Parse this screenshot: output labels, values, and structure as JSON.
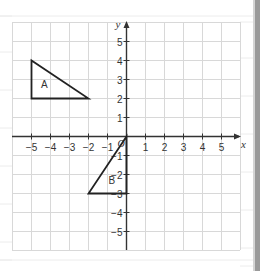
{
  "figure": {
    "x_axis_label": "x",
    "y_axis_label": "y",
    "origin_label": "O",
    "x_range": [
      -6,
      6
    ],
    "y_range": [
      -6,
      6
    ],
    "x_ticks": [
      {
        "value": -5,
        "label": "−5"
      },
      {
        "value": -4,
        "label": "−4"
      },
      {
        "value": -3,
        "label": "−3"
      },
      {
        "value": -2,
        "label": "−2"
      },
      {
        "value": -1,
        "label": "−1"
      },
      {
        "value": 1,
        "label": "1"
      },
      {
        "value": 2,
        "label": "2"
      },
      {
        "value": 3,
        "label": "3"
      },
      {
        "value": 4,
        "label": "4"
      },
      {
        "value": 5,
        "label": "5"
      }
    ],
    "y_ticks": [
      {
        "value": 5,
        "label": "5"
      },
      {
        "value": 4,
        "label": "4"
      },
      {
        "value": 3,
        "label": "3"
      },
      {
        "value": 2,
        "label": "2"
      },
      {
        "value": 1,
        "label": "1"
      },
      {
        "value": -1,
        "label": "−1"
      },
      {
        "value": -2,
        "label": "−2"
      },
      {
        "value": -3,
        "label": "−3"
      },
      {
        "value": -4,
        "label": "−4"
      },
      {
        "value": -5,
        "label": "−5"
      }
    ],
    "shapes": [
      {
        "name": "A",
        "label": "A",
        "vertices": [
          [
            -5,
            4
          ],
          [
            -5,
            2
          ],
          [
            -2,
            2
          ]
        ],
        "label_pos": [
          -4.3,
          2.55
        ]
      },
      {
        "name": "B",
        "label": "B",
        "vertices": [
          [
            0,
            0
          ],
          [
            0,
            -3
          ],
          [
            -2,
            -3
          ]
        ],
        "label_pos": [
          -0.75,
          -2.55
        ]
      }
    ],
    "colors": {
      "grid": "#d8d8d8",
      "axis": "#333333",
      "shape": "#222222",
      "text": "#333333",
      "paper_lines": "#ececec"
    }
  }
}
